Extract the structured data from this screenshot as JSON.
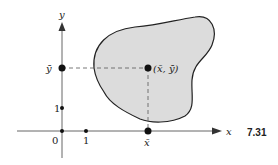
{
  "figure": {
    "number": "7.31",
    "axes": {
      "x_label": "x",
      "y_label": "y",
      "origin_label": "0",
      "x_tick_label": "1",
      "y_tick_label": "1"
    },
    "centroid": {
      "label": "(x̄, ȳ)",
      "x_bar_label": "x̄",
      "y_bar_label": "ȳ"
    },
    "region": {
      "fill": "#dcdcdc",
      "stroke": "#222222"
    }
  }
}
